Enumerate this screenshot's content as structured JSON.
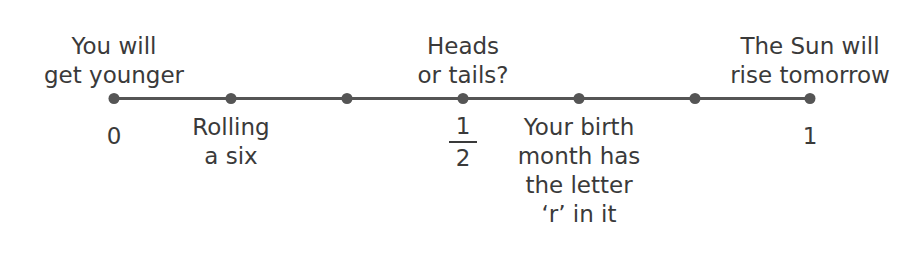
{
  "number_line": {
    "points_x": [
      114,
      231,
      347,
      463,
      579,
      695,
      810
    ],
    "line_color": "#555555"
  },
  "top_labels": [
    {
      "text_lines": [
        "You will",
        "get younger"
      ],
      "x": 114
    },
    {
      "text_lines": [
        "Heads",
        "or tails?"
      ],
      "x": 463
    },
    {
      "text_lines": [
        "The Sun will",
        "rise tomorrow"
      ],
      "x": 810
    }
  ],
  "bottom_labels": [
    {
      "text": "0",
      "x": 114
    },
    {
      "text_lines": [
        "Rolling",
        "a six"
      ],
      "x": 231
    },
    {
      "fraction": {
        "numerator": "1",
        "denominator": "2"
      },
      "x": 463
    },
    {
      "text_lines": [
        "Your birth",
        "month has",
        "the letter",
        "‘r’ in it"
      ],
      "x": 579
    },
    {
      "text": "1",
      "x": 810
    }
  ]
}
